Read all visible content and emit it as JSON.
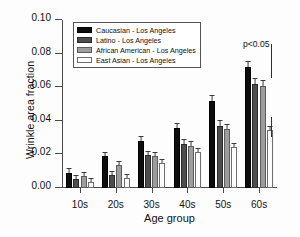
{
  "chart_data": {
    "type": "bar",
    "title": "",
    "xlabel": "Age group",
    "ylabel": "Wrinkle area fraction",
    "categories": [
      "10s",
      "20s",
      "30s",
      "40s",
      "50s",
      "60s"
    ],
    "ylim": [
      0.0,
      0.1
    ],
    "yticks": [
      0.0,
      0.02,
      0.04,
      0.06,
      0.08,
      0.1
    ],
    "ytick_labels": [
      "0.00",
      "0.02",
      "0.04",
      "0.06",
      "0.08",
      "0.10"
    ],
    "grid": false,
    "legend_position": "upper left",
    "series": [
      {
        "name": "Caucasian - Los Angeles",
        "color": "#0d0d0d",
        "values": [
          0.009,
          0.019,
          0.028,
          0.036,
          0.052,
          0.072
        ],
        "errors": [
          0.0022,
          0.0022,
          0.0022,
          0.0022,
          0.0028,
          0.0032
        ]
      },
      {
        "name": "Latino - Los Angeles",
        "color": "#4d4d4d",
        "values": [
          0.0055,
          0.008,
          0.0195,
          0.0263,
          0.0368,
          0.062
        ],
        "errors": [
          0.0018,
          0.0018,
          0.0022,
          0.0022,
          0.0032,
          0.0032
        ]
      },
      {
        "name": "African American - Los Angeles",
        "color": "#9d9d9d",
        "values": [
          0.007,
          0.0135,
          0.019,
          0.025,
          0.0353,
          0.061
        ],
        "errors": [
          0.0022,
          0.0022,
          0.0022,
          0.0022,
          0.0022,
          0.0028
        ]
      },
      {
        "name": "East Asian - Los Angeles",
        "color": "#fcfcfc",
        "values": [
          0.0035,
          0.006,
          0.0148,
          0.0215,
          0.0245,
          0.0345
        ]
      }
    ],
    "annotations": [
      {
        "text": "p<0.05",
        "type": "significance-label"
      },
      {
        "text": "",
        "type": "significance-bar"
      },
      {
        "text": "",
        "type": "significance-bar"
      }
    ]
  },
  "axes": {
    "ylabel": "Wrinkle area fraction",
    "xlabel": "Age group",
    "ytick_labels": [
      "0.00",
      "0.02",
      "0.04",
      "0.06",
      "0.08",
      "0.10"
    ],
    "xtick_labels": [
      "10s",
      "20s",
      "30s",
      "40s",
      "50s",
      "60s"
    ]
  },
  "legend": {
    "items": [
      {
        "label": "Caucasian - Los Angeles"
      },
      {
        "label": "Latino - Los Angeles"
      },
      {
        "label": "African American - Los Angeles"
      },
      {
        "label": "East Asian - Los Angeles"
      }
    ]
  },
  "annotations": {
    "pvalue": "p<0.05"
  }
}
